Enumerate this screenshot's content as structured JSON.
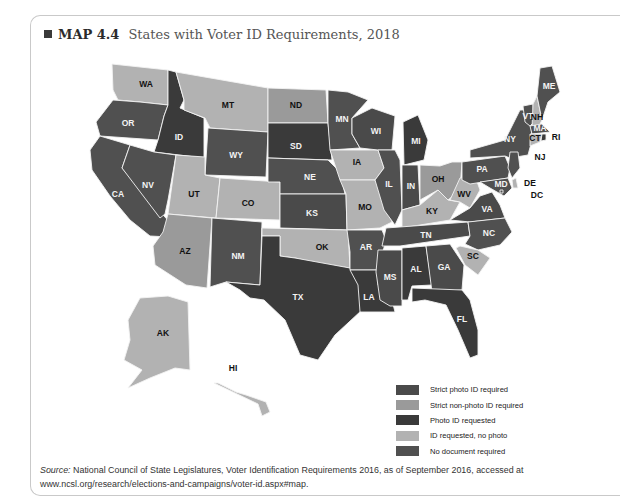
{
  "figure": {
    "label": "MAP 4.4",
    "title": "States with Voter ID Requirements, 2018"
  },
  "legend": [
    {
      "key": "strict_photo",
      "label": "Strict photo ID required",
      "color": "#4a4a4a"
    },
    {
      "key": "strict_nonphoto",
      "label": "Strict non-photo ID required",
      "color": "#9a9a9a"
    },
    {
      "key": "photo_requested",
      "label": "Photo ID requested",
      "color": "#3a3a3a"
    },
    {
      "key": "id_no_photo",
      "label": "ID requested, no photo",
      "color": "#b2b2b2"
    },
    {
      "key": "no_doc",
      "label": "No document required",
      "color": "#505050"
    }
  ],
  "states": [
    {
      "abbr": "WA",
      "cat": "id_no_photo"
    },
    {
      "abbr": "OR",
      "cat": "no_doc"
    },
    {
      "abbr": "CA",
      "cat": "no_doc"
    },
    {
      "abbr": "ID",
      "cat": "photo_requested"
    },
    {
      "abbr": "NV",
      "cat": "no_doc"
    },
    {
      "abbr": "MT",
      "cat": "id_no_photo"
    },
    {
      "abbr": "WY",
      "cat": "no_doc"
    },
    {
      "abbr": "UT",
      "cat": "id_no_photo"
    },
    {
      "abbr": "AZ",
      "cat": "strict_nonphoto"
    },
    {
      "abbr": "CO",
      "cat": "id_no_photo"
    },
    {
      "abbr": "NM",
      "cat": "no_doc"
    },
    {
      "abbr": "ND",
      "cat": "strict_nonphoto"
    },
    {
      "abbr": "SD",
      "cat": "photo_requested"
    },
    {
      "abbr": "NE",
      "cat": "no_doc"
    },
    {
      "abbr": "KS",
      "cat": "strict_photo"
    },
    {
      "abbr": "OK",
      "cat": "id_no_photo"
    },
    {
      "abbr": "TX",
      "cat": "photo_requested"
    },
    {
      "abbr": "MN",
      "cat": "no_doc"
    },
    {
      "abbr": "IA",
      "cat": "id_no_photo"
    },
    {
      "abbr": "MO",
      "cat": "id_no_photo"
    },
    {
      "abbr": "AR",
      "cat": "no_doc"
    },
    {
      "abbr": "LA",
      "cat": "photo_requested"
    },
    {
      "abbr": "WI",
      "cat": "strict_photo"
    },
    {
      "abbr": "IL",
      "cat": "no_doc"
    },
    {
      "abbr": "MS",
      "cat": "strict_photo"
    },
    {
      "abbr": "MI",
      "cat": "photo_requested"
    },
    {
      "abbr": "IN",
      "cat": "strict_photo"
    },
    {
      "abbr": "KY",
      "cat": "id_no_photo"
    },
    {
      "abbr": "TN",
      "cat": "strict_photo"
    },
    {
      "abbr": "AL",
      "cat": "photo_requested"
    },
    {
      "abbr": "GA",
      "cat": "strict_photo"
    },
    {
      "abbr": "FL",
      "cat": "photo_requested"
    },
    {
      "abbr": "OH",
      "cat": "strict_nonphoto"
    },
    {
      "abbr": "WV",
      "cat": "id_no_photo"
    },
    {
      "abbr": "VA",
      "cat": "strict_photo"
    },
    {
      "abbr": "NC",
      "cat": "no_doc"
    },
    {
      "abbr": "SC",
      "cat": "id_no_photo"
    },
    {
      "abbr": "PA",
      "cat": "no_doc"
    },
    {
      "abbr": "NY",
      "cat": "no_doc"
    },
    {
      "abbr": "VT",
      "cat": "no_doc"
    },
    {
      "abbr": "NH",
      "cat": "id_no_photo"
    },
    {
      "abbr": "ME",
      "cat": "no_doc"
    },
    {
      "abbr": "MA",
      "cat": "no_doc"
    },
    {
      "abbr": "CT",
      "cat": "id_no_photo"
    },
    {
      "abbr": "RI",
      "cat": "photo_requested"
    },
    {
      "abbr": "NJ",
      "cat": "no_doc"
    },
    {
      "abbr": "DE",
      "cat": "id_no_photo"
    },
    {
      "abbr": "MD",
      "cat": "no_doc"
    },
    {
      "abbr": "DC",
      "cat": "no_doc"
    },
    {
      "abbr": "AK",
      "cat": "id_no_photo"
    },
    {
      "abbr": "HI",
      "cat": "id_no_photo"
    }
  ],
  "source": {
    "prefix": "Source:",
    "text": "National Council of State Legislatures, Voter Identification Requirements 2016, as of September 2016, accessed at www.ncsl.org/research/elections-and-campaigns/voter-id.aspx#map."
  }
}
